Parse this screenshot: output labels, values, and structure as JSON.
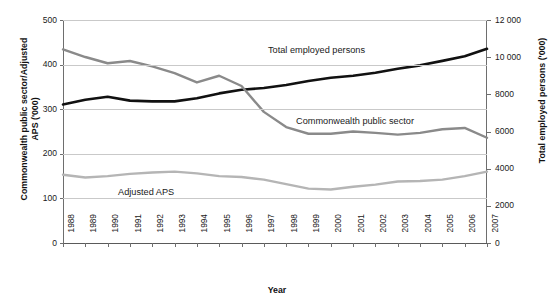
{
  "title_clipped": "Total employed persons",
  "axes": {
    "x_title": "Year",
    "y_left_title": "Commonwealth public sector/Adjusted APS ('000)",
    "y_right_title": "Total employed persons ('000)",
    "y_left_ticks": [
      "0",
      "100",
      "200",
      "300",
      "400",
      "500"
    ],
    "y_right_ticks": [
      "0",
      "2000",
      "4000",
      "6000",
      "8000",
      "10 000",
      "12 000"
    ],
    "x_ticks": [
      "1988",
      "1989",
      "1990",
      "1991",
      "1992",
      "1993",
      "1994",
      "1995",
      "1996",
      "1997",
      "1998",
      "1999",
      "2000",
      "2001",
      "2002",
      "2003",
      "2004",
      "2005",
      "2006",
      "2007"
    ]
  },
  "annotations": {
    "total_employed": "Total employed persons",
    "commonwealth": "Commonwealth public sector",
    "adjusted_aps": "Adjusted APS"
  },
  "colors": {
    "total_employed": "#111111",
    "commonwealth": "#8a8a8a",
    "adjusted_aps": "#b5b5b5",
    "gridline": "#c9c9c9",
    "axis": "#6e6e6e"
  },
  "chart_data": {
    "type": "line",
    "title": "Total employed persons",
    "xlabel": "Year",
    "ylabel": "Commonwealth public sector/Adjusted APS ('000)",
    "ylabel_secondary": "Total employed persons ('000)",
    "ylim": [
      0,
      500
    ],
    "ylim_secondary": [
      0,
      12000
    ],
    "grid": true,
    "legend": "inline-annotations",
    "x": [
      "1988",
      "1989",
      "1990",
      "1991",
      "1992",
      "1993",
      "1994",
      "1995",
      "1996",
      "1997",
      "1998",
      "1999",
      "2000",
      "2001",
      "2002",
      "2003",
      "2004",
      "2005",
      "2006",
      "2007"
    ],
    "series": [
      {
        "name": "Total employed persons",
        "axis": "right",
        "units": "'000",
        "color": "#111111",
        "values": [
          7450,
          7710,
          7870,
          7660,
          7620,
          7620,
          7790,
          8050,
          8250,
          8340,
          8500,
          8720,
          8890,
          9000,
          9160,
          9380,
          9560,
          9800,
          10050,
          10450
        ]
      },
      {
        "name": "Commonwealth public sector",
        "axis": "left",
        "units": "'000",
        "color": "#8a8a8a",
        "values": [
          434,
          417,
          403,
          408,
          396,
          381,
          360,
          375,
          352,
          294,
          260,
          245,
          245,
          250,
          247,
          243,
          247,
          255,
          258,
          236
        ]
      },
      {
        "name": "Adjusted APS",
        "axis": "left",
        "units": "'000",
        "color": "#b5b5b5",
        "values": [
          153,
          147,
          150,
          155,
          158,
          160,
          156,
          150,
          148,
          142,
          132,
          122,
          120,
          126,
          131,
          138,
          139,
          142,
          150,
          160
        ]
      }
    ]
  }
}
